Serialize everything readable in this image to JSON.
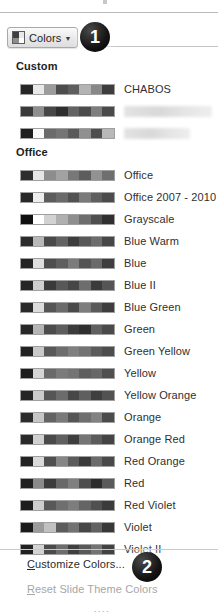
{
  "window": {
    "title": "Theme Colors Gallery"
  },
  "toolbar": {
    "colors_button_label": "Colors",
    "colors_button_icon": "color-palette-icon",
    "caret_icon": "chevron-down-icon"
  },
  "groups": [
    {
      "header": "Custom",
      "items": [
        {
          "label": "CHABOS",
          "redacted": false,
          "colors": [
            "#262626",
            "#e9e9e9",
            "#9c9c9c",
            "#4d4d4d",
            "#5e5e5e",
            "#b3b3b3",
            "#888888",
            "#3d3d3d"
          ]
        },
        {
          "label": "",
          "redacted": true,
          "colors": [
            "#3a3a3a",
            "#8f8f8f",
            "#474747",
            "#2e2e2e",
            "#636363",
            "#4b4b4b",
            "#7e7e7e",
            "#4a4a4a"
          ]
        },
        {
          "label": "",
          "redacted": true,
          "redacted_short": true,
          "colors": [
            "#1f1f1f",
            "#fbfbfb",
            "#6b6b6b",
            "#757575",
            "#5a5a5a",
            "#909090",
            "#4f4f4f",
            "#b8b8b8"
          ]
        }
      ]
    },
    {
      "header": "Office",
      "items": [
        {
          "label": "Office",
          "redacted": false,
          "colors": [
            "#2d2d2d",
            "#e6e6e6",
            "#8d8d8d",
            "#a2a2a2",
            "#787878",
            "#5d5d5d",
            "#929292",
            "#6f6f6f"
          ]
        },
        {
          "label": "Office 2007 - 2010",
          "redacted": false,
          "colors": [
            "#282828",
            "#ededed",
            "#5c5c5c",
            "#6a6a6a",
            "#515151",
            "#7a7a7a",
            "#5f5f5f",
            "#4c4c4c"
          ]
        },
        {
          "label": "Grayscale",
          "redacted": false,
          "colors": [
            "#101010",
            "#ffffff",
            "#d2d2d2",
            "#b0b0b0",
            "#8f8f8f",
            "#6e6e6e",
            "#4f4f4f",
            "#303030"
          ]
        },
        {
          "label": "Blue Warm",
          "redacted": false,
          "colors": [
            "#2b2b2b",
            "#b8b8b8",
            "#4a4a4a",
            "#636363",
            "#3d3d3d",
            "#585858",
            "#6d6d6d",
            "#474747"
          ]
        },
        {
          "label": "Blue",
          "redacted": false,
          "colors": [
            "#242424",
            "#dedede",
            "#4e4e4e",
            "#5f5f5f",
            "#7b7b7b",
            "#545454",
            "#6a6a6a",
            "#3f3f3f"
          ]
        },
        {
          "label": "Blue II",
          "redacted": false,
          "colors": [
            "#262626",
            "#cfcfcf",
            "#3a3a3a",
            "#585858",
            "#464646",
            "#6d6d6d",
            "#3b3b3b",
            "#555555"
          ]
        },
        {
          "label": "Blue Green",
          "redacted": false,
          "colors": [
            "#2a2a2a",
            "#dcdcdc",
            "#555555",
            "#6b6b6b",
            "#4a4a4a",
            "#7d7d7d",
            "#5a5a5a",
            "#3e3e3e"
          ]
        },
        {
          "label": "Green",
          "redacted": false,
          "colors": [
            "#272727",
            "#b5b5b5",
            "#4c4c4c",
            "#5e5e5e",
            "#3c3c3c",
            "#2f2f2f",
            "#606060",
            "#4a4a4a"
          ]
        },
        {
          "label": "Green Yellow",
          "redacted": false,
          "colors": [
            "#222222",
            "#c9c9c9",
            "#595959",
            "#6e6e6e",
            "#808080",
            "#737373",
            "#5b5b5b",
            "#4d4d4d"
          ]
        },
        {
          "label": "Yellow",
          "redacted": false,
          "colors": [
            "#1e1e1e",
            "#d5d5d5",
            "#6a6a6a",
            "#7b7b7b",
            "#747474",
            "#5e5e5e",
            "#686868",
            "#4f4f4f"
          ]
        },
        {
          "label": "Yellow Orange",
          "redacted": false,
          "colors": [
            "#252525",
            "#cccccc",
            "#565656",
            "#6c6c6c",
            "#474747",
            "#5f5f5f",
            "#3f3f3f",
            "#525252"
          ]
        },
        {
          "label": "Orange",
          "redacted": false,
          "colors": [
            "#2c2c2c",
            "#c6c6c6",
            "#636363",
            "#7a7a7a",
            "#555555",
            "#6e6e6e",
            "#828282",
            "#4b4b4b"
          ]
        },
        {
          "label": "Orange Red",
          "redacted": false,
          "colors": [
            "#292929",
            "#d0d0d0",
            "#4a4a4a",
            "#606060",
            "#3e3e3e",
            "#757575",
            "#5b5b5b",
            "#444444"
          ]
        },
        {
          "label": "Red Orange",
          "redacted": false,
          "colors": [
            "#232323",
            "#dadada",
            "#4f4f4f",
            "#868686",
            "#5c5c5c",
            "#3a3a3a",
            "#6b6b6b",
            "#494949"
          ]
        },
        {
          "label": "Red",
          "redacted": false,
          "colors": [
            "#202020",
            "#8a8a8a",
            "#3c3c3c",
            "#686868",
            "#7f7f7f",
            "#4e4e4e",
            "#2d2d2d",
            "#5a5a5a"
          ]
        },
        {
          "label": "Red Violet",
          "redacted": false,
          "colors": [
            "#1d1d1d",
            "#cdcdcd",
            "#585858",
            "#6f6f6f",
            "#7d7d7d",
            "#646464",
            "#505050",
            "#3b3b3b"
          ]
        },
        {
          "label": "Violet",
          "redacted": false,
          "colors": [
            "#1a1a1a",
            "#9b9b9b",
            "#c1c1c1",
            "#5c5c5c",
            "#727272",
            "#464646",
            "#616161",
            "#383838"
          ]
        },
        {
          "label": "Violet II",
          "redacted": false,
          "colors": [
            "#212121",
            "#d3d3d3",
            "#4b4b4b",
            "#6d6d6d",
            "#3f3f3f",
            "#595959",
            "#747474",
            "#424242"
          ]
        }
      ]
    }
  ],
  "commands": {
    "customize": "Customize Colors...",
    "customize_accelerator": "C",
    "reset": "Reset Slide Theme Colors",
    "reset_accelerator": "R",
    "reset_enabled": false,
    "overflow_dots": "...."
  },
  "callouts": [
    {
      "number": "1",
      "target": "colors-button"
    },
    {
      "number": "2",
      "target": "customize-colors-command"
    }
  ],
  "colors": {
    "badge_fill": "#000000",
    "badge_text": "#ffffff",
    "text": "#2c2c2c",
    "disabled_text": "#a6a6a6",
    "rule": "#c4c4c4"
  }
}
